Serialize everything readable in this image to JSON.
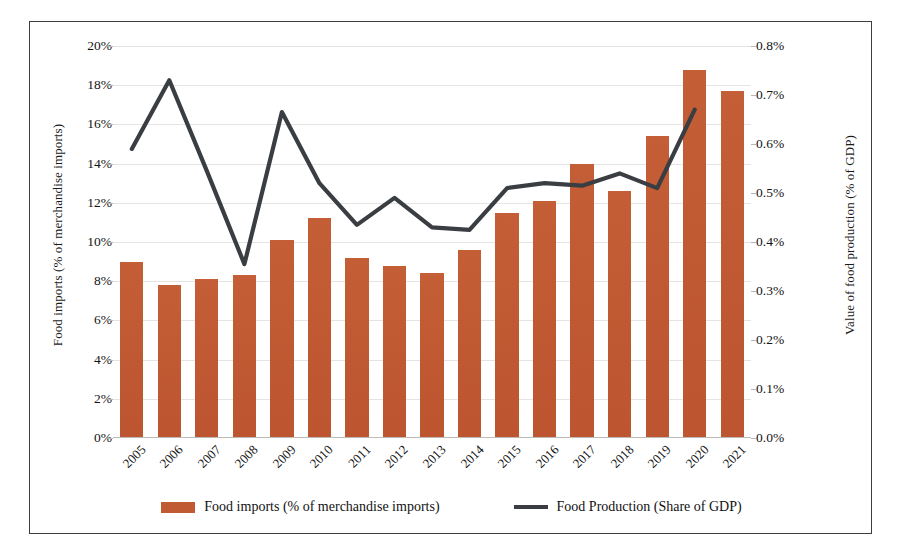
{
  "chart_data": {
    "type": "bar",
    "title": "",
    "xlabel": "",
    "categories": [
      "2005",
      "2006",
      "2007",
      "2008",
      "2009",
      "2010",
      "2011",
      "2012",
      "2013",
      "2014",
      "2015",
      "2016",
      "2017",
      "2018",
      "2019",
      "2020",
      "2021"
    ],
    "grid": true,
    "legend_position": "bottom",
    "series": [
      {
        "name": "Food imports (% of merchandise imports)",
        "type": "bar",
        "axis": "left",
        "color": "#C05A33",
        "unit": "%",
        "values": [
          9.0,
          7.8,
          8.1,
          8.3,
          10.1,
          11.2,
          9.2,
          8.8,
          8.4,
          9.6,
          11.5,
          12.1,
          14.0,
          12.6,
          15.4,
          18.8,
          17.7
        ]
      },
      {
        "name": "Food Production (Share of GDP)",
        "type": "line",
        "axis": "right",
        "color": "#3A3E42",
        "unit": "%",
        "values": [
          0.59,
          0.73,
          0.545,
          0.355,
          0.665,
          0.52,
          0.435,
          0.49,
          0.43,
          0.425,
          0.51,
          0.52,
          0.515,
          0.54,
          0.51,
          0.67,
          null
        ]
      }
    ],
    "axes": {
      "left": {
        "label": "Food imports (% of merchandise imports)",
        "min": 0,
        "max": 20,
        "step": 2,
        "ticks": [
          "0%",
          "2%",
          "4%",
          "6%",
          "8%",
          "10%",
          "12%",
          "14%",
          "16%",
          "18%",
          "20%"
        ]
      },
      "right": {
        "label": "Value of food production (% of GDP)",
        "min": 0,
        "max": 0.8,
        "step": 0.1,
        "ticks": [
          "0.0%",
          "0.1%",
          "0.2%",
          "0.3%",
          "0.4%",
          "0.5%",
          "0.6%",
          "0.7%",
          "0.8%"
        ]
      }
    },
    "legend": [
      {
        "label": "Food imports (% of merchandise imports)",
        "marker": "bar-swatch",
        "color": "#C05A33"
      },
      {
        "label": "Food Production (Share of GDP)",
        "marker": "line-swatch",
        "color": "#3A3E42"
      }
    ]
  }
}
